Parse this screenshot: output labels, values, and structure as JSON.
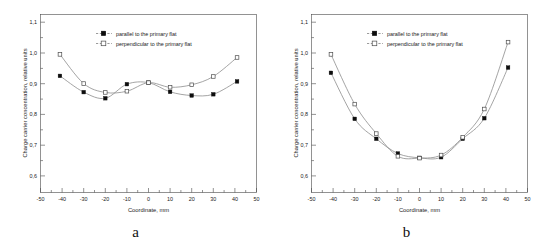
{
  "figure": {
    "panels": [
      {
        "caption": "a",
        "chart_data": {
          "type": "line",
          "title": "",
          "xlabel": "Coordinate, mm",
          "ylabel": "Charge carrier concentration, relative units",
          "xlim": [
            -50,
            50
          ],
          "ylim": [
            0.55,
            1.13
          ],
          "xticks": [
            -50,
            -40,
            -30,
            -20,
            -10,
            0,
            10,
            20,
            30,
            40,
            50
          ],
          "xtick_labels": [
            "-50",
            "-40",
            "-30",
            "-20",
            "-10",
            "0",
            "10",
            "20",
            "30",
            "40",
            "50"
          ],
          "yticks": [
            0.6,
            0.7,
            0.8,
            0.9,
            1.0,
            1.1
          ],
          "ytick_labels": [
            "0,6",
            "0,7",
            "0,8",
            "0,9",
            "1,0",
            "1,1"
          ],
          "minor_xticks": true,
          "grid": false,
          "legend_position": "top-center",
          "series": [
            {
              "name": "parallel to the primary flat",
              "marker": "filled-square",
              "x": [
                -41,
                -30,
                -20,
                -10,
                0,
                10,
                20,
                30,
                41
              ],
              "values": [
                0.93,
                0.877,
                0.857,
                0.903,
                0.908,
                0.878,
                0.866,
                0.87,
                0.912
              ]
            },
            {
              "name": "perpendicular to the primary flat",
              "marker": "open-square",
              "x": [
                -41,
                -30,
                -20,
                -10,
                0,
                10,
                20,
                30,
                41
              ],
              "values": [
                1.0,
                0.905,
                0.876,
                0.88,
                0.908,
                0.893,
                0.901,
                0.928,
                0.99
              ]
            }
          ]
        }
      },
      {
        "caption": "b",
        "chart_data": {
          "type": "line",
          "title": "",
          "xlabel": "Coordinate, mm",
          "ylabel": "Charge carrier concentration, relative units",
          "xlim": [
            -50,
            50
          ],
          "ylim": [
            0.55,
            1.13
          ],
          "xticks": [
            -50,
            -40,
            -30,
            -20,
            -10,
            0,
            10,
            20,
            30,
            40,
            50
          ],
          "xtick_labels": [
            "-50",
            "-40",
            "-30",
            "-20",
            "-10",
            "0",
            "10",
            "20",
            "30",
            "40",
            "50"
          ],
          "yticks": [
            0.6,
            0.7,
            0.8,
            0.9,
            1.0,
            1.1
          ],
          "ytick_labels": [
            "0,6",
            "0,7",
            "0,8",
            "0,9",
            "1,0",
            "1,1"
          ],
          "minor_xticks": true,
          "grid": false,
          "legend_position": "top-center",
          "series": [
            {
              "name": "parallel to the primary flat",
              "marker": "filled-square",
              "x": [
                -41,
                -30,
                -20,
                -10,
                0,
                10,
                20,
                30,
                41
              ],
              "values": [
                0.94,
                0.79,
                0.725,
                0.677,
                0.663,
                0.665,
                0.725,
                0.792,
                0.957
              ]
            },
            {
              "name": "perpendicular to the primary flat",
              "marker": "open-square",
              "x": [
                -41,
                -30,
                -20,
                -10,
                0,
                10,
                20,
                30,
                41
              ],
              "values": [
                1.0,
                0.838,
                0.742,
                0.668,
                0.662,
                0.672,
                0.73,
                0.822,
                1.04
              ]
            }
          ]
        }
      }
    ]
  },
  "colors": {
    "curve": "#8d8d8d",
    "marker_filled": "#0d0d0d",
    "marker_open_edge": "#4d4d4d",
    "axis": "#4a4a4a",
    "background": "#ffffff"
  }
}
